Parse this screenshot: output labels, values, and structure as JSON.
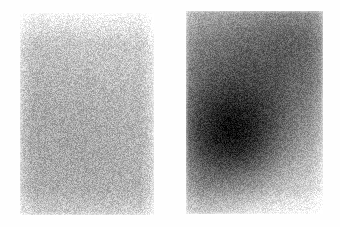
{
  "figure": {
    "name": "two-panel-grayscale-noise-comparison",
    "background_color": "#fefefe",
    "width": 340,
    "height": 227,
    "caption": "",
    "title": ""
  },
  "panels": [
    {
      "id": "panel-left",
      "label": "",
      "role": "reference-uniform-noise-panel",
      "x": 20,
      "y": 13,
      "width": 134,
      "height": 202,
      "appearance": "fine-grained uniform light gray speckle, slight darkening toward the lower middle, lighter along the top edge",
      "base_gray": "#c9c9c9",
      "mean_gray_hex": "#c6c6c6",
      "noise_amplitude": 52,
      "grain_size_px": 1,
      "blobs": [
        {
          "cx_pct": 46,
          "cy_pct": 62,
          "radius_pct": 70,
          "strength": 0.16,
          "color": "#8f8f8f"
        },
        {
          "cx_pct": 30,
          "cy_pct": 46,
          "radius_pct": 48,
          "strength": 0.1,
          "color": "#9a9a9a"
        },
        {
          "cx_pct": 55,
          "cy_pct": 14,
          "radius_pct": 52,
          "strength": -0.14,
          "color": "#f2f2f2"
        }
      ],
      "edge_fade": {
        "top": 0.3,
        "right": 0.22,
        "bottom": 0.18,
        "left": 0.18
      }
    },
    {
      "id": "panel-right",
      "label": "",
      "role": "signal-radial-gradient-panel",
      "x": 186,
      "y": 11,
      "width": 137,
      "height": 203,
      "appearance": "fine-grained gray speckle with a pronounced dark radial blob left of center, secondary darkening at top right, lightening toward bottom right",
      "base_gray": "#b4b4b4",
      "mean_gray_hex": "#a9a9a9",
      "noise_amplitude": 46,
      "grain_size_px": 1,
      "blobs": [
        {
          "cx_pct": 40,
          "cy_pct": 58,
          "radius_pct": 42,
          "strength": 0.62,
          "color": "#5c5c5c"
        },
        {
          "cx_pct": 33,
          "cy_pct": 64,
          "radius_pct": 24,
          "strength": 0.38,
          "color": "#4a4a4a"
        },
        {
          "cx_pct": 82,
          "cy_pct": 12,
          "radius_pct": 34,
          "strength": 0.34,
          "color": "#6e6e6e"
        },
        {
          "cx_pct": 18,
          "cy_pct": 22,
          "radius_pct": 40,
          "strength": 0.14,
          "color": "#8a8a8a"
        },
        {
          "cx_pct": 92,
          "cy_pct": 88,
          "radius_pct": 44,
          "strength": -0.26,
          "color": "#e6e6e6"
        },
        {
          "cx_pct": 50,
          "cy_pct": 99,
          "radius_pct": 34,
          "strength": -0.18,
          "color": "#dedede"
        }
      ],
      "edge_fade": {
        "top": 0.14,
        "right": 0.16,
        "bottom": 0.2,
        "left": 0.12
      }
    }
  ],
  "legend": {
    "visible": false,
    "entries": []
  },
  "axes": {
    "visible": false
  },
  "annotations": []
}
